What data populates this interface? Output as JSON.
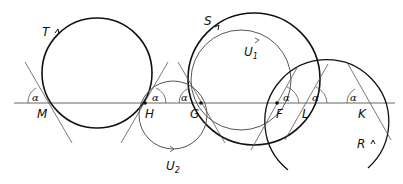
{
  "diagram": {
    "type": "geometry",
    "colors": {
      "stroke": "#111111",
      "thin": "#444444",
      "background": "#ffffff"
    },
    "line": {
      "label": ""
    },
    "points": [
      {
        "id": "M",
        "label": "M"
      },
      {
        "id": "H",
        "label": "H"
      },
      {
        "id": "G",
        "label": "G"
      },
      {
        "id": "F",
        "label": "F"
      },
      {
        "id": "L",
        "label": "L"
      },
      {
        "id": "K",
        "label": "K"
      }
    ],
    "circles": [
      {
        "id": "T",
        "label": "T"
      },
      {
        "id": "S",
        "label": "S"
      },
      {
        "id": "U1",
        "label": "U",
        "sub": "1"
      },
      {
        "id": "U2",
        "label": "U",
        "sub": "2"
      },
      {
        "id": "R",
        "label": "R"
      }
    ],
    "angle_label": "α",
    "angles": [
      {
        "at": "M",
        "label": "α"
      },
      {
        "at": "H",
        "label": "α"
      },
      {
        "at": "G",
        "label": "α"
      },
      {
        "at": "F",
        "label": "α"
      },
      {
        "at": "L",
        "label": "α"
      },
      {
        "at": "K",
        "label": "α"
      }
    ]
  }
}
